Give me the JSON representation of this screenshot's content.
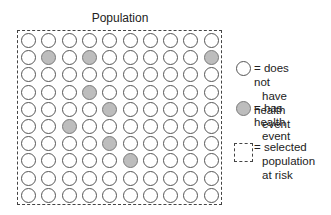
{
  "title": "Population",
  "grid": {
    "rows": 10,
    "cols": 10,
    "filled": [
      [
        2,
        2
      ],
      [
        2,
        4
      ],
      [
        2,
        10
      ],
      [
        4,
        4
      ],
      [
        5,
        5
      ],
      [
        6,
        3
      ],
      [
        7,
        5
      ],
      [
        8,
        6
      ]
    ]
  },
  "legend": {
    "items": [
      {
        "symbol": "empty-circle",
        "label_lines": [
          "= does not",
          "have health",
          "event"
        ]
      },
      {
        "symbol": "filled-circle",
        "label_lines": [
          "= has health",
          "event"
        ]
      },
      {
        "symbol": "dashed-square",
        "label_lines": [
          "= selected",
          "population",
          "at risk"
        ]
      }
    ]
  },
  "colors": {
    "filled_circle": "#bdbdbd",
    "outline": "#555555",
    "background": "#ffffff"
  }
}
